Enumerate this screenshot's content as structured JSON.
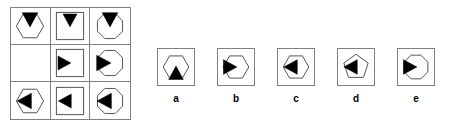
{
  "puzzle": {
    "type": "visual-analogy-matrix",
    "colors": {
      "grid_line": "#808080",
      "shape_outline": "#555555",
      "fill": "#000000",
      "background": "#ffffff",
      "label": "#000000"
    },
    "matrix": {
      "rows": 3,
      "cols": 3,
      "cells": [
        {
          "id": "cell-r1c1",
          "outline": "hexagon",
          "marker": "triangle-down",
          "marker_position": "top",
          "empty": false
        },
        {
          "id": "cell-r1c2",
          "outline": "square",
          "marker": "triangle-down",
          "marker_position": "top",
          "empty": false
        },
        {
          "id": "cell-r1c3",
          "outline": "octagon",
          "marker": "triangle-down",
          "marker_position": "top",
          "empty": false
        },
        {
          "id": "cell-r2c1",
          "outline": "none",
          "marker": "none",
          "marker_position": "none",
          "empty": true
        },
        {
          "id": "cell-r2c2",
          "outline": "square",
          "marker": "triangle-right",
          "marker_position": "left",
          "empty": false
        },
        {
          "id": "cell-r2c3",
          "outline": "octagon",
          "marker": "triangle-right",
          "marker_position": "left",
          "empty": false
        },
        {
          "id": "cell-r3c1",
          "outline": "hexagon",
          "marker": "triangle-left",
          "marker_position": "right",
          "empty": false
        },
        {
          "id": "cell-r3c2",
          "outline": "square",
          "marker": "triangle-left",
          "marker_position": "right",
          "empty": false
        },
        {
          "id": "cell-r3c3",
          "outline": "octagon",
          "marker": "triangle-left",
          "marker_position": "right",
          "empty": false
        }
      ]
    },
    "options": [
      {
        "label": "a",
        "outline": "hexagon",
        "marker": "triangle-up",
        "marker_position": "bottom"
      },
      {
        "label": "b",
        "outline": "hexagon",
        "marker": "triangle-right",
        "marker_position": "left"
      },
      {
        "label": "c",
        "outline": "hexagon",
        "marker": "triangle-left",
        "marker_position": "left"
      },
      {
        "label": "d",
        "outline": "pentagon",
        "marker": "triangle-left",
        "marker_position": "left"
      },
      {
        "label": "e",
        "outline": "octagon",
        "marker": "triangle-right",
        "marker_position": "left"
      }
    ]
  }
}
